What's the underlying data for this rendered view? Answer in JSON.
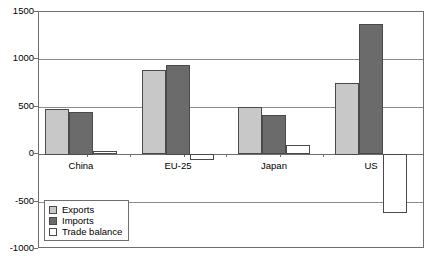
{
  "chart_data": {
    "type": "bar",
    "title": "",
    "subtitle": "",
    "xlabel": "",
    "ylabel": "",
    "categories": [
      "China",
      "EU-25",
      "Japan",
      "US"
    ],
    "series": [
      {
        "name": "Exports",
        "color": "#c8c8c8",
        "values": [
          480,
          885,
          500,
          755
        ]
      },
      {
        "name": "Imports",
        "color": "#6b6b6b",
        "values": [
          450,
          945,
          410,
          1375
        ]
      },
      {
        "name": "Trade balance",
        "color": "#ffffff",
        "values": [
          35,
          -60,
          95,
          -620
        ]
      }
    ],
    "ylim": [
      -1000,
      1500
    ],
    "yticks": [
      1500,
      1000,
      500,
      0,
      -500,
      -1000
    ],
    "ytick_labels": [
      "1500",
      "1000",
      "500",
      "0",
      "-500",
      "-1000"
    ],
    "grid": true,
    "legend_position": "lower-left",
    "legend_entries": [
      "Exports",
      "Imports",
      "Trade balance"
    ]
  },
  "axis": {
    "y_ticks": [
      {
        "label": "1500"
      },
      {
        "label": "1000"
      },
      {
        "label": "500"
      },
      {
        "label": "0"
      },
      {
        "label": "-500"
      },
      {
        "label": "-1000"
      }
    ]
  },
  "legend": {
    "items": [
      {
        "label": "Exports"
      },
      {
        "label": "Imports"
      },
      {
        "label": "Trade balance"
      }
    ]
  }
}
